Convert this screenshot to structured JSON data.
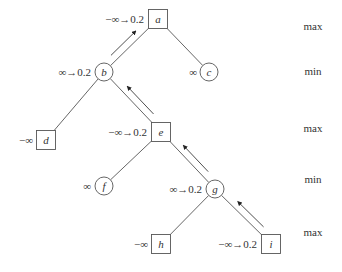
{
  "diagram": {
    "type": "alpha-beta game tree",
    "levels": [
      {
        "label": "max",
        "y": 30
      },
      {
        "label": "min",
        "y": 75
      },
      {
        "label": "max",
        "y": 132
      },
      {
        "label": "min",
        "y": 183
      },
      {
        "label": "max",
        "y": 236
      }
    ],
    "nodes": [
      {
        "id": "a",
        "name": "a",
        "shape": "square",
        "x": 158,
        "y": 19,
        "value": "−∞→0.2",
        "vx": 144,
        "vy": 23
      },
      {
        "id": "b",
        "name": "b",
        "shape": "circle",
        "x": 104,
        "y": 72,
        "value": "∞→0.2",
        "vx": 91,
        "vy": 76
      },
      {
        "id": "c",
        "name": "c",
        "shape": "circle",
        "x": 209,
        "y": 72,
        "value": "∞",
        "vx": 197,
        "vy": 76
      },
      {
        "id": "d",
        "name": "d",
        "shape": "square",
        "x": 46,
        "y": 140,
        "value": "−∞",
        "vx": 33,
        "vy": 144
      },
      {
        "id": "e",
        "name": "e",
        "shape": "square",
        "x": 161,
        "y": 132,
        "value": "−∞→0.2",
        "vx": 147,
        "vy": 136
      },
      {
        "id": "f",
        "name": "f",
        "shape": "circle",
        "x": 104,
        "y": 186,
        "value": "∞",
        "vx": 91,
        "vy": 190
      },
      {
        "id": "g",
        "name": "g",
        "shape": "circle",
        "x": 215,
        "y": 189,
        "value": "∞→0.2",
        "vx": 202,
        "vy": 193
      },
      {
        "id": "h",
        "name": "h",
        "shape": "square",
        "x": 161,
        "y": 244,
        "value": "−∞",
        "vx": 148,
        "vy": 248
      },
      {
        "id": "i",
        "name": "i",
        "shape": "square",
        "x": 271,
        "y": 244,
        "value": "−∞→0.2",
        "vx": 257,
        "vy": 248
      }
    ],
    "edges": [
      [
        "a",
        "b"
      ],
      [
        "a",
        "c"
      ],
      [
        "b",
        "d"
      ],
      [
        "b",
        "e"
      ],
      [
        "e",
        "f"
      ],
      [
        "e",
        "g"
      ],
      [
        "g",
        "h"
      ],
      [
        "g",
        "i"
      ]
    ],
    "arrows": [
      {
        "from": "b",
        "to": "a"
      },
      {
        "from": "e",
        "to": "b"
      },
      {
        "from": "g",
        "to": "e"
      },
      {
        "from": "i",
        "to": "g"
      }
    ]
  }
}
